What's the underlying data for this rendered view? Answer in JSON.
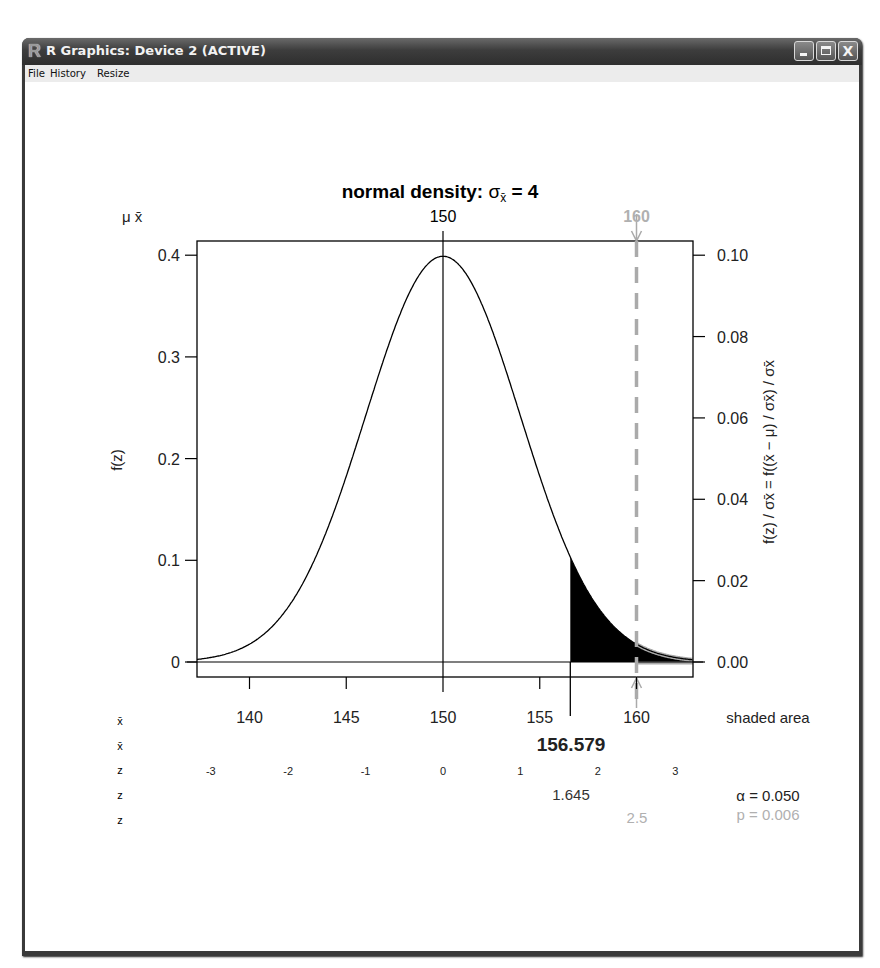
{
  "window": {
    "title": "R Graphics: Device 2 (ACTIVE)",
    "logo": "R",
    "buttons": [
      {
        "name": "minimize",
        "icon": "minimize-icon"
      },
      {
        "name": "maximize",
        "icon": "maximize-icon"
      },
      {
        "name": "close",
        "icon": "close-icon",
        "glyph": "X"
      }
    ]
  },
  "menu": [
    {
      "label": "File"
    },
    {
      "label": "History"
    },
    {
      "label": "Resize"
    }
  ],
  "plot": {
    "title_prefix": "normal density:  ",
    "title_sigma": "σ",
    "title_sub": "x̄",
    "title_suffix": " = 4",
    "top_axis_label_left": "μ  x̄",
    "top_axis_ticks": [
      {
        "value": 150,
        "label": "150",
        "color": "#000000"
      },
      {
        "value": 160,
        "label": "160",
        "color": "#b0b0b0"
      }
    ],
    "left_ylabel": "f(z)",
    "right_ylabel": "f(z) / σx̄ = f((x̄ − μ) / σx̄) / σx̄",
    "left_ticks": [
      {
        "v": 0,
        "label": "0"
      },
      {
        "v": 0.1,
        "label": "0.1"
      },
      {
        "v": 0.2,
        "label": "0.2"
      },
      {
        "v": 0.3,
        "label": "0.3"
      },
      {
        "v": 0.4,
        "label": "0.4"
      }
    ],
    "right_ticks": [
      {
        "v": 0,
        "label": "0.00"
      },
      {
        "v": 0.02,
        "label": "0.02"
      },
      {
        "v": 0.04,
        "label": "0.04"
      },
      {
        "v": 0.06,
        "label": "0.06"
      },
      {
        "v": 0.08,
        "label": "0.08"
      },
      {
        "v": 0.1,
        "label": "0.10"
      }
    ],
    "bottom_ticks": [
      {
        "v": 140,
        "label": "140"
      },
      {
        "v": 145,
        "label": "145"
      },
      {
        "v": 150,
        "label": "150"
      },
      {
        "v": 155,
        "label": "155"
      },
      {
        "v": 160,
        "label": "160"
      }
    ],
    "z_ticks": [
      {
        "v": -3,
        "label": "-3"
      },
      {
        "v": -2,
        "label": "-2"
      },
      {
        "v": -1,
        "label": "-1"
      },
      {
        "v": 0,
        "label": "0"
      },
      {
        "v": 1,
        "label": "1"
      },
      {
        "v": 2,
        "label": "2"
      },
      {
        "v": 3,
        "label": "3"
      }
    ],
    "row_labels": [
      "x̄",
      "x̄",
      "z",
      "z",
      "z"
    ],
    "critical_xbar": "156.579",
    "critical_z": "1.645",
    "observed_z": "2.5",
    "shaded_area_label": "shaded area",
    "alpha_label": "α = 0.050",
    "p_label": "p = 0.006",
    "colors": {
      "curve": "#000000",
      "shade": "#000000",
      "observed": "#aaaaaa",
      "observed_text": "#b0b0b0"
    }
  },
  "chart_data": {
    "type": "area",
    "title": "normal density: σx̄ = 4",
    "distribution": "normal",
    "mu": 150,
    "sigma_xbar": 4,
    "x_range": [
      137.15,
      163.05
    ],
    "ylim_left": [
      0,
      0.4
    ],
    "ylim_right": [
      0,
      0.1
    ],
    "xlabel": "x̄",
    "ylabel_left": "f(z)",
    "ylabel_right": "f(z)/σx̄ = f((x̄−μ)/σx̄)/σx̄",
    "x_ticks": [
      140,
      145,
      150,
      155,
      160
    ],
    "z_ticks": [
      -3,
      -2,
      -1,
      0,
      1,
      2,
      3
    ],
    "critical_value_xbar": 156.579,
    "critical_value_z": 1.645,
    "alpha": 0.05,
    "observed_xbar": 160,
    "observed_z": 2.5,
    "p_value": 0.006,
    "shaded_region": {
      "from_xbar": 156.579,
      "to": "right tail",
      "area": 0.05
    },
    "observed_region": {
      "from_xbar": 160,
      "to": "right tail",
      "area": 0.006
    }
  }
}
